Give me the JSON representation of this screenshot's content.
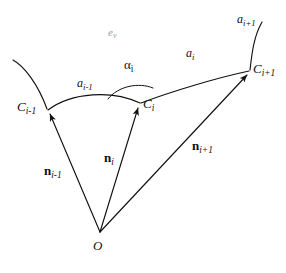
{
  "figure": {
    "type": "geometry-diagram",
    "background_color": "#ffffff",
    "stroke_color": "#111111",
    "faint_color": "#9a9a9a",
    "width": 286,
    "height": 273
  },
  "labels": {
    "point_c_prev": {
      "base": "C",
      "sub": "i-1"
    },
    "point_c_curr": {
      "base": "C",
      "sub": "i"
    },
    "point_c_next": {
      "base": "C",
      "sub": "i+1"
    },
    "arc_a_prev": {
      "base": "a",
      "sub": "i-1"
    },
    "arc_a_curr": {
      "base": "a",
      "sub": "i"
    },
    "arc_a_next": {
      "base": "a",
      "sub": "i+1"
    },
    "angle_alpha": {
      "base": "α",
      "sub": "i"
    },
    "vector_n_prev": {
      "base": "n",
      "sub": "i-1"
    },
    "vector_n_curr": {
      "base": "n",
      "sub": "i"
    },
    "vector_n_next": {
      "base": "n",
      "sub": "i+1"
    },
    "origin": {
      "base": "O",
      "sub": ""
    },
    "surface_ev": {
      "base": "e",
      "sub": "v"
    }
  },
  "geometry": {
    "origin_point": {
      "x": 100,
      "y": 232
    },
    "points": [
      {
        "name": "C_i-1",
        "x": 48,
        "y": 110
      },
      {
        "name": "C_i",
        "x": 140,
        "y": 104
      },
      {
        "name": "C_i+1",
        "x": 250,
        "y": 71
      }
    ],
    "curve_tail_start": {
      "x": 13,
      "y": 60
    },
    "curve_tail_end": {
      "x": 262,
      "y": 22
    }
  }
}
